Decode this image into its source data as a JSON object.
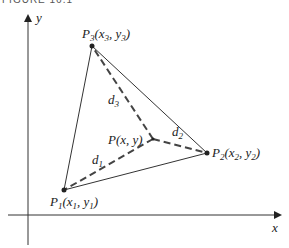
{
  "figure": {
    "caption": "FIGURE 16.1"
  },
  "axes": {
    "x_label": "x",
    "y_label": "y"
  },
  "points": {
    "P1": {
      "name": "P",
      "sub": "1",
      "coord": "(x",
      "coord_sub_x": "1",
      "sep": ", y",
      "coord_sub_y": "1",
      "close": ")"
    },
    "P2": {
      "name": "P",
      "sub": "2",
      "coord": "(x",
      "coord_sub_x": "2",
      "sep": ", y",
      "coord_sub_y": "2",
      "close": ")"
    },
    "P3": {
      "name": "P",
      "sub": "3",
      "coord": "(x",
      "coord_sub_x": "3",
      "sep": ", y",
      "coord_sub_y": "3",
      "close": ")"
    },
    "P": {
      "label": "P(x, y)"
    }
  },
  "distances": {
    "d1": {
      "name": "d",
      "sub": "1"
    },
    "d2": {
      "name": "d",
      "sub": "2"
    },
    "d3": {
      "name": "d",
      "sub": "3"
    }
  },
  "colors": {
    "stroke": "#333333",
    "dashed": "#444444"
  }
}
